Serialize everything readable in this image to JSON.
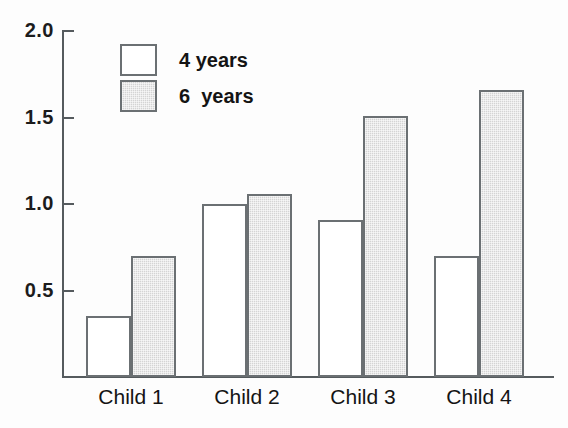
{
  "chart_data": {
    "type": "bar",
    "title": "",
    "subtitle": "",
    "xlabel": "",
    "ylabel": "",
    "categories": [
      "Child 1",
      "Child 2",
      "Child 3",
      "Child 4"
    ],
    "series": [
      {
        "name": "4 years",
        "values": [
          0.35,
          1.0,
          0.91,
          0.7
        ],
        "fill": "#ffffff",
        "stroke": "#6b7073"
      },
      {
        "name": "6  years",
        "values": [
          0.7,
          1.06,
          1.51,
          1.66
        ],
        "fill": "#d4d4d4",
        "stroke": "#6b7073"
      }
    ],
    "ylim": [
      0,
      2.0
    ],
    "yticks": [
      0.5,
      1.0,
      1.5,
      2.0
    ],
    "ytick_labels": [
      "0.5",
      "1.0",
      "1.5",
      "2.0"
    ],
    "grid": false,
    "legend_position": "upper-left-inside",
    "legend_entries": [
      "4 years",
      "6  years"
    ]
  },
  "axis": {
    "y_ticks": [
      {
        "label": "2.0",
        "value": 2.0
      },
      {
        "label": "1.5",
        "value": 1.5
      },
      {
        "label": "1.0",
        "value": 1.0
      },
      {
        "label": "0.5",
        "value": 0.5
      }
    ],
    "x_categories": [
      {
        "label": "Child 1"
      },
      {
        "label": "Child 2"
      },
      {
        "label": "Child 3"
      },
      {
        "label": "Child 4"
      }
    ]
  },
  "legend": {
    "items": [
      {
        "label": "4 years"
      },
      {
        "label": "6  years"
      }
    ]
  }
}
